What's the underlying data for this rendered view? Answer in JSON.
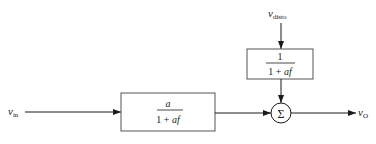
{
  "diagram": {
    "type": "block-diagram",
    "inputs": {
      "v_in": {
        "symbol": "v",
        "subscript": "in"
      },
      "v_disto": {
        "symbol": "v",
        "subscript": "disto"
      }
    },
    "output": {
      "symbol": "v",
      "subscript": "O"
    },
    "blocks": {
      "main": {
        "numerator": "a",
        "denominator_prefix": "1 + ",
        "denominator_var": "af"
      },
      "disturbance": {
        "numerator": "1",
        "denominator_prefix": "1 + ",
        "denominator_var": "af"
      }
    },
    "summer": {
      "symbol": "Σ"
    },
    "colors": {
      "stroke": "#1a1a1a",
      "background": "#ffffff"
    }
  }
}
